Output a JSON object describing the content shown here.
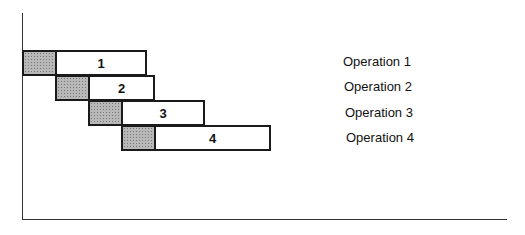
{
  "diagram": {
    "type": "staggered-overlapping-operations",
    "rows": [
      {
        "id": "1",
        "bar_label": "1",
        "operation_label": "Operation 1",
        "shaded_segment": {
          "x": 22,
          "w": 34
        },
        "main_segment": {
          "x": 55,
          "w": 92
        },
        "y": 50,
        "h": 26,
        "label_x": 343,
        "label_y": 54
      },
      {
        "id": "2",
        "bar_label": "2",
        "operation_label": "Operation 2",
        "shaded_segment": {
          "x": 55,
          "w": 35
        },
        "main_segment": {
          "x": 88,
          "w": 67
        },
        "y": 75,
        "h": 26,
        "label_x": 344,
        "label_y": 79
      },
      {
        "id": "3",
        "bar_label": "3",
        "operation_label": "Operation 3",
        "shaded_segment": {
          "x": 88,
          "w": 34
        },
        "main_segment": {
          "x": 121,
          "w": 84
        },
        "y": 100,
        "h": 26,
        "label_x": 345,
        "label_y": 105
      },
      {
        "id": "4",
        "bar_label": "4",
        "operation_label": "Operation 4",
        "shaded_segment": {
          "x": 121,
          "w": 34
        },
        "main_segment": {
          "x": 154,
          "w": 117
        },
        "y": 125,
        "h": 26,
        "label_x": 346,
        "label_y": 130
      }
    ],
    "colors": {
      "outline": "#1a1a1a",
      "shade": "#b8b8b8",
      "background": "#ffffff",
      "axis": "#333333"
    },
    "axes": {
      "y_axis": {
        "x": 22,
        "top": 13,
        "bottom": 220
      },
      "x_axis": {
        "y": 219,
        "left": 22,
        "right": 507
      }
    }
  }
}
